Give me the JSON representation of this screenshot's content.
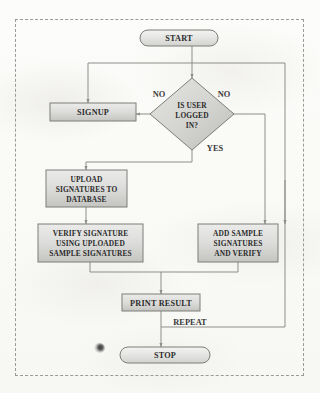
{
  "diagram": {
    "type": "flowchart",
    "colors": {
      "node_fill_light": "#e8e8e6",
      "node_fill_dark": "#c3c3c0",
      "node_stroke": "#7c7c79",
      "edge": "#8d8d8a",
      "text": "#2b2b2b",
      "frame_border": "#9a9a96",
      "background": "#fbfbf9"
    },
    "nodes": [
      {
        "id": "start",
        "shape": "terminator",
        "lines": [
          "START"
        ]
      },
      {
        "id": "decision",
        "shape": "diamond",
        "lines": [
          "IS USER",
          "LOGGED",
          "IN?"
        ]
      },
      {
        "id": "signup",
        "shape": "process",
        "lines": [
          "SIGNUP"
        ]
      },
      {
        "id": "upload",
        "shape": "process",
        "lines": [
          "UPLOAD",
          "SIGNATURES TO",
          "DATABASE"
        ]
      },
      {
        "id": "verify",
        "shape": "process",
        "lines": [
          "VERIFY SIGNATURE",
          "USING UPLOADED",
          "SAMPLE SIGNATURES"
        ]
      },
      {
        "id": "addsample",
        "shape": "process",
        "lines": [
          "ADD SAMPLE",
          "SIGNATURES",
          "AND VERIFY"
        ]
      },
      {
        "id": "print",
        "shape": "process",
        "lines": [
          "PRINT RESULT"
        ]
      },
      {
        "id": "stop",
        "shape": "terminator",
        "lines": [
          "STOP"
        ]
      }
    ],
    "edge_labels": {
      "no_left": "NO",
      "no_right": "NO",
      "yes": "YES",
      "repeat": "REPEAT"
    }
  }
}
